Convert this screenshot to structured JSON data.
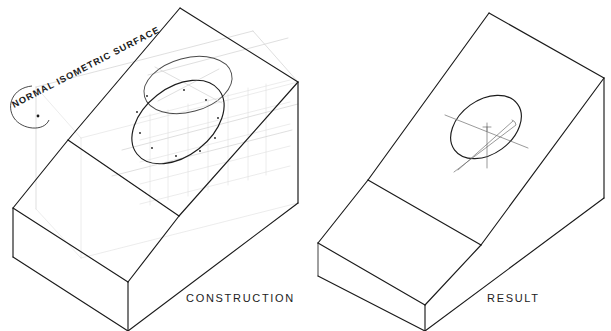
{
  "figure": {
    "title_visible": false,
    "background_color": "#ffffff",
    "line_color": "#1a1a1a",
    "construction_color": "#c9c9c9",
    "center_line_color": "#6e6e6e"
  },
  "captions": {
    "left": "CONSTRUCTION",
    "right": "RESULT"
  },
  "annotations": {
    "normal_surface_label": "NORMAL ISOMETRIC SURFACE"
  },
  "left_figure": {
    "name": "construction-view",
    "caption": "CONSTRUCTION",
    "description": "Isometric inclined-surface block shown with light construction geometry, an isometric horizontal ellipse and the projected ellipse on the inclined normal surface",
    "elements": [
      "enclosing-construction-box",
      "isometric-grid-lines",
      "upper-horizontal-ellipse",
      "lower-projected-ellipse",
      "ellipse-plot-points",
      "leader-loop-callout"
    ]
  },
  "right_figure": {
    "name": "result-view",
    "caption": "RESULT",
    "description": "Finished isometric block with the completed ellipse and its center lines on the inclined surface",
    "elements": [
      "solid-object-outline",
      "finished-ellipse",
      "ellipse-center-lines"
    ]
  }
}
